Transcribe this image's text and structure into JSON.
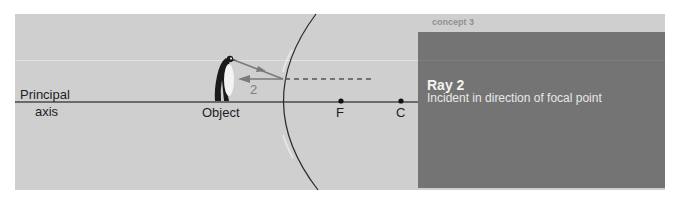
{
  "header": {
    "concept_label": "concept 3"
  },
  "diagram": {
    "axis_label_line1": "Principal",
    "axis_label_line2": "axis",
    "object_label": "Object",
    "focal_label": "F",
    "center_label": "C",
    "ray_number": "2"
  },
  "info_box": {
    "title": "Ray 2",
    "description": "Incident in direction of focal point"
  },
  "colors": {
    "panel_bg": "#cfcfcf",
    "info_box_bg": "#747474",
    "ray_color": "#7a7a7a",
    "axis_color": "#4a4a4a"
  }
}
